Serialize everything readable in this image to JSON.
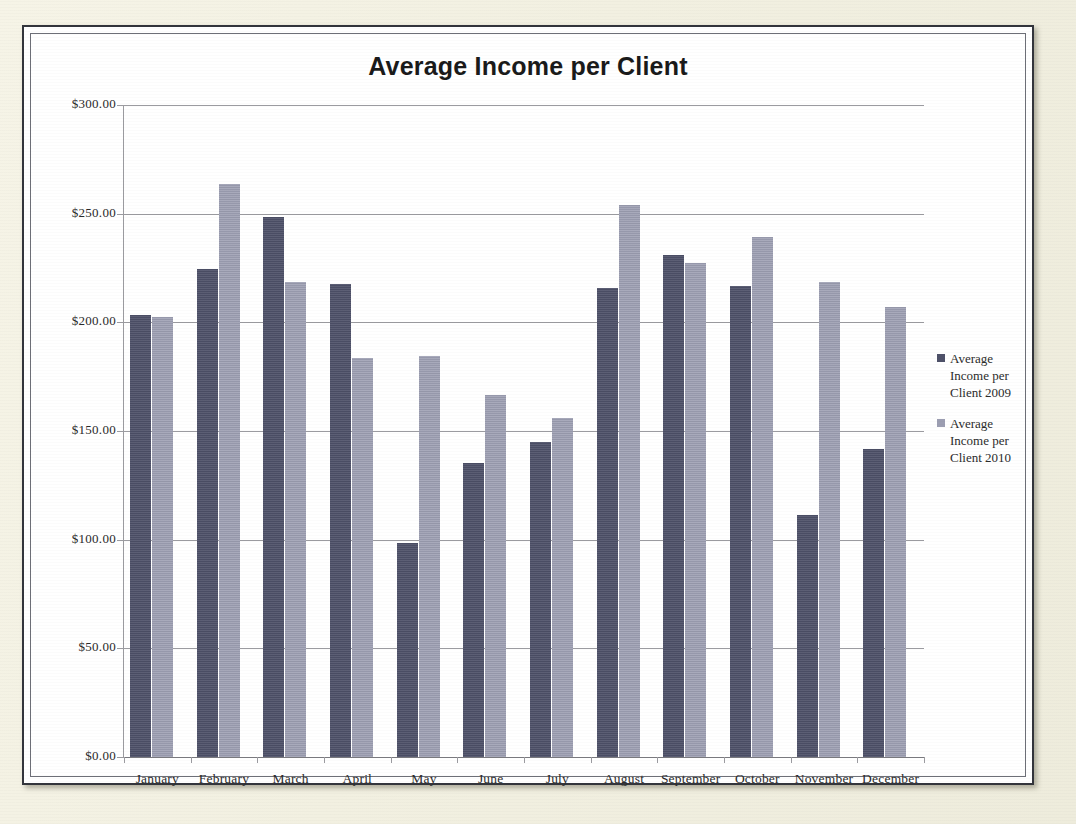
{
  "chart_data": {
    "type": "bar",
    "title": "Average Income per Client",
    "xlabel": "",
    "ylabel": "",
    "ylim": [
      0,
      300
    ],
    "ytick_step": 50,
    "ytick_labels": [
      "$300.00",
      "$250.00",
      "$200.00",
      "$150.00",
      "$100.00",
      "$50.00",
      "$0.00"
    ],
    "ytick_values": [
      300,
      250,
      200,
      150,
      100,
      50,
      0
    ],
    "grid": true,
    "legend_position": "right",
    "categories": [
      "January",
      "February",
      "March",
      "April",
      "May",
      "June",
      "July",
      "August",
      "September",
      "October",
      "November",
      "December"
    ],
    "series": [
      {
        "name": "Average Income per Client 2009",
        "color": "#4e5169",
        "values": [
          203.5,
          224.5,
          248.5,
          217.5,
          98.5,
          135.5,
          145.0,
          216.0,
          231.0,
          216.5,
          111.5,
          141.5
        ]
      },
      {
        "name": "Average Income per Client 2010",
        "color": "#9c9eb2",
        "values": [
          202.5,
          263.5,
          218.5,
          183.5,
          184.5,
          166.5,
          156.0,
          254.0,
          227.5,
          239.5,
          218.5,
          207.0
        ]
      }
    ]
  },
  "chart": {
    "title": "Average Income per Client"
  },
  "legend": {
    "entries": [
      {
        "label": "Average Income per Client 2009",
        "color": "#4e5169"
      },
      {
        "label": "Average Income per Client 2010",
        "color": "#9c9eb2"
      }
    ]
  },
  "colors": {
    "series_2009": "#4e5169",
    "series_2010": "#9c9eb2",
    "gridline": "#9b9ba0",
    "frame_border": "#33353c",
    "page_background": "#f2f0e1",
    "plot_background": "#ffffff"
  }
}
